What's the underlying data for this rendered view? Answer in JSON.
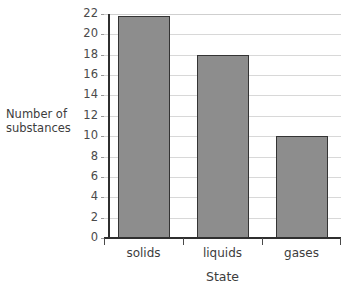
{
  "chart_data": {
    "type": "bar",
    "title": "",
    "xlabel": "State",
    "ylabel": "Number of substances",
    "categories": [
      "solids",
      "liquids",
      "gases"
    ],
    "values": [
      21.8,
      18,
      10
    ],
    "ylim": [
      0,
      22
    ],
    "ytick_step": 2,
    "yticks": [
      0,
      2,
      4,
      6,
      8,
      10,
      12,
      14,
      16,
      18,
      20,
      22
    ],
    "ytick_labels": [
      "0",
      "2",
      "4",
      "6",
      "8",
      "10",
      "12",
      "14",
      "16",
      "18",
      "20",
      "22"
    ],
    "grid": "horizontal",
    "legend": "none",
    "series": [
      {
        "name": "Number of substances",
        "values": [
          21.8,
          18,
          10
        ]
      }
    ],
    "colors": {
      "bar_fill": "#8d8d8d",
      "bar_border": "#343434",
      "gridline": "#d8d8d8",
      "axis": "#2f2f2f",
      "text": "#3d3d3d",
      "background": "#ffffff"
    }
  },
  "axis": {
    "y_title_line1": "Number of",
    "y_title_line2": "substances",
    "x_title": "State"
  }
}
